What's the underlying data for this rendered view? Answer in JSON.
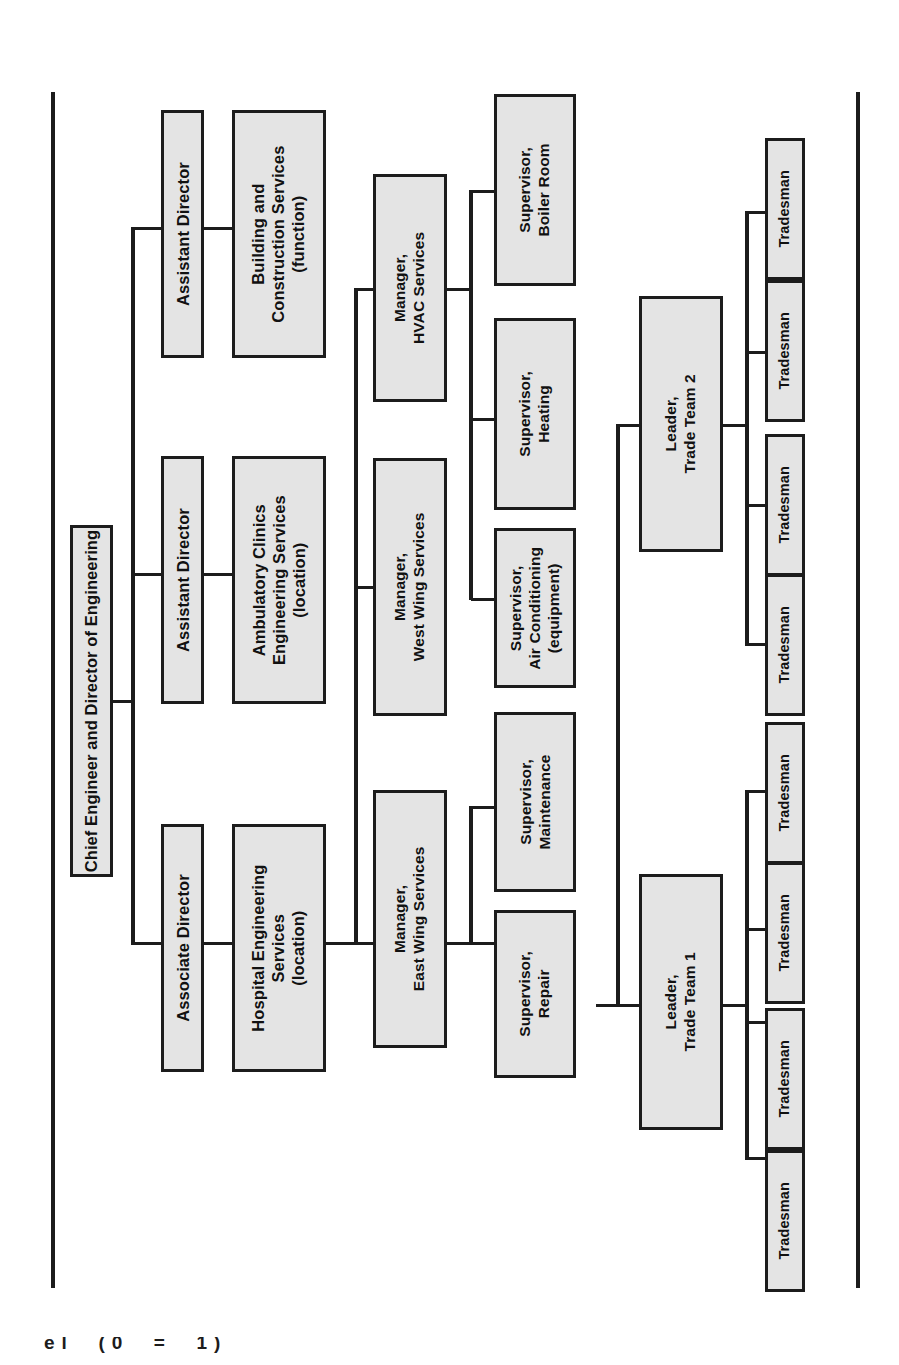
{
  "chart": {
    "title": "Chief Engineer and Director of Engineering",
    "orientation": "rotated-90-ccw",
    "box_fill": "#e4e4e4",
    "box_border": "#1c1c1c",
    "line_color": "#1c1c1c",
    "page_background": "#ffffff"
  },
  "root": {
    "label": "Chief Engineer and Director of Engineering"
  },
  "directors": [
    {
      "label": "Assistant Director"
    },
    {
      "label": "Assistant Director"
    },
    {
      "label": "Associate Director"
    }
  ],
  "divisions": [
    {
      "label": "Building and\nConstruction Services\n(function)"
    },
    {
      "label": "Ambulatory Clinics\nEngineering Services\n(location)"
    },
    {
      "label": "Hospital Engineering\nServices\n(location)"
    }
  ],
  "managers": [
    {
      "label": "Manager,\nHVAC Services"
    },
    {
      "label": "Manager,\nWest Wing Services"
    },
    {
      "label": "Manager,\nEast Wing Services"
    }
  ],
  "supervisors": [
    {
      "label": "Supervisor,\nBoiler Room"
    },
    {
      "label": "Supervisor,\nHeating"
    },
    {
      "label": "Supervisor,\nAir Conditioning\n(equipment)"
    },
    {
      "label": "Supervisor,\nMaintenance"
    },
    {
      "label": "Supervisor,\nRepair"
    }
  ],
  "leaders": [
    {
      "label": "Leader,\nTrade Team 2"
    },
    {
      "label": "Leader,\nTrade Team 1"
    }
  ],
  "tradesmen_team2": [
    {
      "label": "Tradesman"
    },
    {
      "label": "Tradesman"
    },
    {
      "label": "Tradesman"
    },
    {
      "label": "Tradesman"
    }
  ],
  "tradesmen_team1": [
    {
      "label": "Tradesman"
    },
    {
      "label": "Tradesman"
    },
    {
      "label": "Tradesman"
    },
    {
      "label": "Tradesman"
    }
  ],
  "footer": {
    "cutoff_text": "el  (0  =  1)"
  }
}
